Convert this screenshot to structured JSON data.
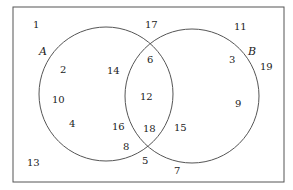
{
  "diagram": {
    "type": "venn",
    "universe_box": {
      "x": 13,
      "y": 7,
      "w": 271,
      "h": 175
    },
    "sets": [
      {
        "name": "A",
        "cx": 106,
        "cy": 94,
        "r": 67,
        "label_x": 39,
        "label_y": 55
      },
      {
        "name": "B",
        "cx": 192,
        "cy": 96,
        "r": 67,
        "label_x": 248,
        "label_y": 55
      }
    ],
    "regions": {
      "outside": [
        {
          "v": "1",
          "x": 33,
          "y": 28
        },
        {
          "v": "17",
          "x": 145,
          "y": 28
        },
        {
          "v": "11",
          "x": 234,
          "y": 30
        },
        {
          "v": "19",
          "x": 260,
          "y": 70
        },
        {
          "v": "13",
          "x": 27,
          "y": 166
        },
        {
          "v": "5",
          "x": 142,
          "y": 164
        },
        {
          "v": "7",
          "x": 174,
          "y": 174
        }
      ],
      "A_only": [
        {
          "v": "2",
          "x": 60,
          "y": 73
        },
        {
          "v": "14",
          "x": 107,
          "y": 74
        },
        {
          "v": "10",
          "x": 52,
          "y": 103
        },
        {
          "v": "4",
          "x": 69,
          "y": 127
        },
        {
          "v": "16",
          "x": 112,
          "y": 130
        },
        {
          "v": "8",
          "x": 123,
          "y": 150
        }
      ],
      "A_and_B": [
        {
          "v": "6",
          "x": 147,
          "y": 63
        },
        {
          "v": "12",
          "x": 140,
          "y": 100
        },
        {
          "v": "18",
          "x": 143,
          "y": 132
        }
      ],
      "B_only": [
        {
          "v": "3",
          "x": 229,
          "y": 63
        },
        {
          "v": "9",
          "x": 235,
          "y": 107
        },
        {
          "v": "15",
          "x": 174,
          "y": 131
        }
      ]
    }
  }
}
